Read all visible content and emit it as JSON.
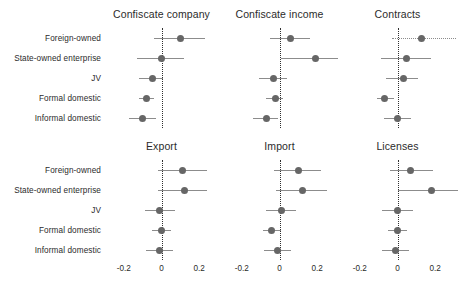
{
  "chart_data": {
    "type": "scatter",
    "title": "",
    "subtitle": "",
    "plot_style": "coefficient forest plot, 2 rows x 3 columns of small-multiple panels",
    "xlabel": "",
    "ylabel": "",
    "xlim": [
      -0.3,
      0.3
    ],
    "xticks": [
      -0.2,
      0,
      0.2
    ],
    "xtick_labels": [
      "-0.2",
      "0",
      "0.2"
    ],
    "grid": false,
    "legend": "none",
    "zero_reference_line": {
      "value": 0,
      "style": "dotted",
      "color": "#2f2f2f"
    },
    "marker": {
      "shape": "circle",
      "color": "#666666"
    },
    "error_bar": {
      "style": "line",
      "color": "#8c8c8c"
    },
    "categories": [
      "Foreign-owned",
      "State-owned enterprise",
      "JV",
      "Formal domestic",
      "Informal domestic"
    ],
    "panels": [
      {
        "title": "Confiscate company",
        "points": [
          {
            "category": "Foreign-owned",
            "estimate": 0.1,
            "low": -0.04,
            "high": 0.23,
            "ci_dotted": false
          },
          {
            "category": "State-owned enterprise",
            "estimate": 0.0,
            "low": -0.13,
            "high": 0.12,
            "ci_dotted": false
          },
          {
            "category": "JV",
            "estimate": -0.05,
            "low": -0.12,
            "high": 0.01,
            "ci_dotted": false
          },
          {
            "category": "Formal domestic",
            "estimate": -0.08,
            "low": -0.12,
            "high": -0.04,
            "ci_dotted": false
          },
          {
            "category": "Informal domestic",
            "estimate": -0.1,
            "low": -0.17,
            "high": -0.03,
            "ci_dotted": false
          }
        ]
      },
      {
        "title": "Confiscate income",
        "points": [
          {
            "category": "Foreign-owned",
            "estimate": 0.06,
            "low": -0.05,
            "high": 0.16,
            "ci_dotted": false
          },
          {
            "category": "State-owned enterprise",
            "estimate": 0.19,
            "low": 0.01,
            "high": 0.31,
            "ci_dotted": false
          },
          {
            "category": "JV",
            "estimate": -0.03,
            "low": -0.11,
            "high": 0.04,
            "ci_dotted": false
          },
          {
            "category": "Formal domestic",
            "estimate": -0.02,
            "low": -0.07,
            "high": 0.02,
            "ci_dotted": false
          },
          {
            "category": "Informal domestic",
            "estimate": -0.07,
            "low": -0.14,
            "high": -0.01,
            "ci_dotted": false
          }
        ]
      },
      {
        "title": "Contracts",
        "points": [
          {
            "category": "Foreign-owned",
            "estimate": 0.13,
            "low": -0.03,
            "high": 0.31,
            "ci_dotted": true
          },
          {
            "category": "State-owned enterprise",
            "estimate": 0.05,
            "low": -0.09,
            "high": 0.18,
            "ci_dotted": false
          },
          {
            "category": "JV",
            "estimate": 0.03,
            "low": -0.06,
            "high": 0.11,
            "ci_dotted": false
          },
          {
            "category": "Formal domestic",
            "estimate": -0.07,
            "low": -0.11,
            "high": -0.02,
            "ci_dotted": false
          },
          {
            "category": "Informal domestic",
            "estimate": 0.0,
            "low": -0.07,
            "high": 0.07,
            "ci_dotted": false
          }
        ]
      },
      {
        "title": "Export",
        "points": [
          {
            "category": "Foreign-owned",
            "estimate": 0.11,
            "low": -0.02,
            "high": 0.24,
            "ci_dotted": false
          },
          {
            "category": "State-owned enterprise",
            "estimate": 0.12,
            "low": -0.02,
            "high": 0.24,
            "ci_dotted": false
          },
          {
            "category": "JV",
            "estimate": -0.01,
            "low": -0.09,
            "high": 0.07,
            "ci_dotted": false
          },
          {
            "category": "Formal domestic",
            "estimate": 0.0,
            "low": -0.05,
            "high": 0.05,
            "ci_dotted": false
          },
          {
            "category": "Informal domestic",
            "estimate": -0.01,
            "low": -0.08,
            "high": 0.06,
            "ci_dotted": false
          }
        ]
      },
      {
        "title": "Import",
        "points": [
          {
            "category": "Foreign-owned",
            "estimate": 0.1,
            "low": -0.03,
            "high": 0.22,
            "ci_dotted": false
          },
          {
            "category": "State-owned enterprise",
            "estimate": 0.12,
            "low": -0.02,
            "high": 0.25,
            "ci_dotted": false
          },
          {
            "category": "JV",
            "estimate": 0.01,
            "low": -0.07,
            "high": 0.09,
            "ci_dotted": false
          },
          {
            "category": "Formal domestic",
            "estimate": -0.04,
            "low": -0.09,
            "high": 0.01,
            "ci_dotted": false
          },
          {
            "category": "Informal domestic",
            "estimate": -0.01,
            "low": -0.08,
            "high": 0.06,
            "ci_dotted": false
          }
        ]
      },
      {
        "title": "Licenses",
        "points": [
          {
            "category": "Foreign-owned",
            "estimate": 0.07,
            "low": -0.04,
            "high": 0.19,
            "ci_dotted": false
          },
          {
            "category": "State-owned enterprise",
            "estimate": 0.18,
            "low": 0.0,
            "high": 0.32,
            "ci_dotted": false
          },
          {
            "category": "JV",
            "estimate": 0.0,
            "low": -0.08,
            "high": 0.08,
            "ci_dotted": false
          },
          {
            "category": "Formal domestic",
            "estimate": 0.0,
            "low": -0.05,
            "high": 0.05,
            "ci_dotted": false
          },
          {
            "category": "Informal domestic",
            "estimate": -0.01,
            "low": -0.08,
            "high": 0.06,
            "ci_dotted": false
          }
        ]
      }
    ]
  }
}
